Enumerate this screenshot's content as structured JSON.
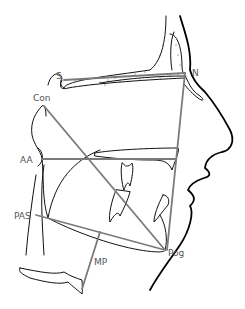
{
  "diagram": {
    "type": "cephalometric-tracing",
    "landmarks": [
      {
        "id": "S",
        "label": "S"
      },
      {
        "id": "N",
        "label": "N"
      },
      {
        "id": "Con",
        "label": "Con"
      },
      {
        "id": "AA",
        "label": "AA"
      },
      {
        "id": "PAS",
        "label": "PAS"
      },
      {
        "id": "MP",
        "label": "MP"
      },
      {
        "id": "Pog",
        "label": "Pog"
      }
    ],
    "reference_lines": [
      {
        "from": "S",
        "to": "N"
      },
      {
        "from": "N",
        "to": "Pog"
      },
      {
        "from": "Con",
        "to": "Pog"
      },
      {
        "from": "AA",
        "to": "palate"
      },
      {
        "from": "PAS",
        "to": "Pog"
      },
      {
        "from": "MP",
        "to": "hyoid"
      }
    ],
    "colors": {
      "outline": "#111111",
      "reference_line": "#7a7a7a",
      "label": "#555555"
    }
  }
}
